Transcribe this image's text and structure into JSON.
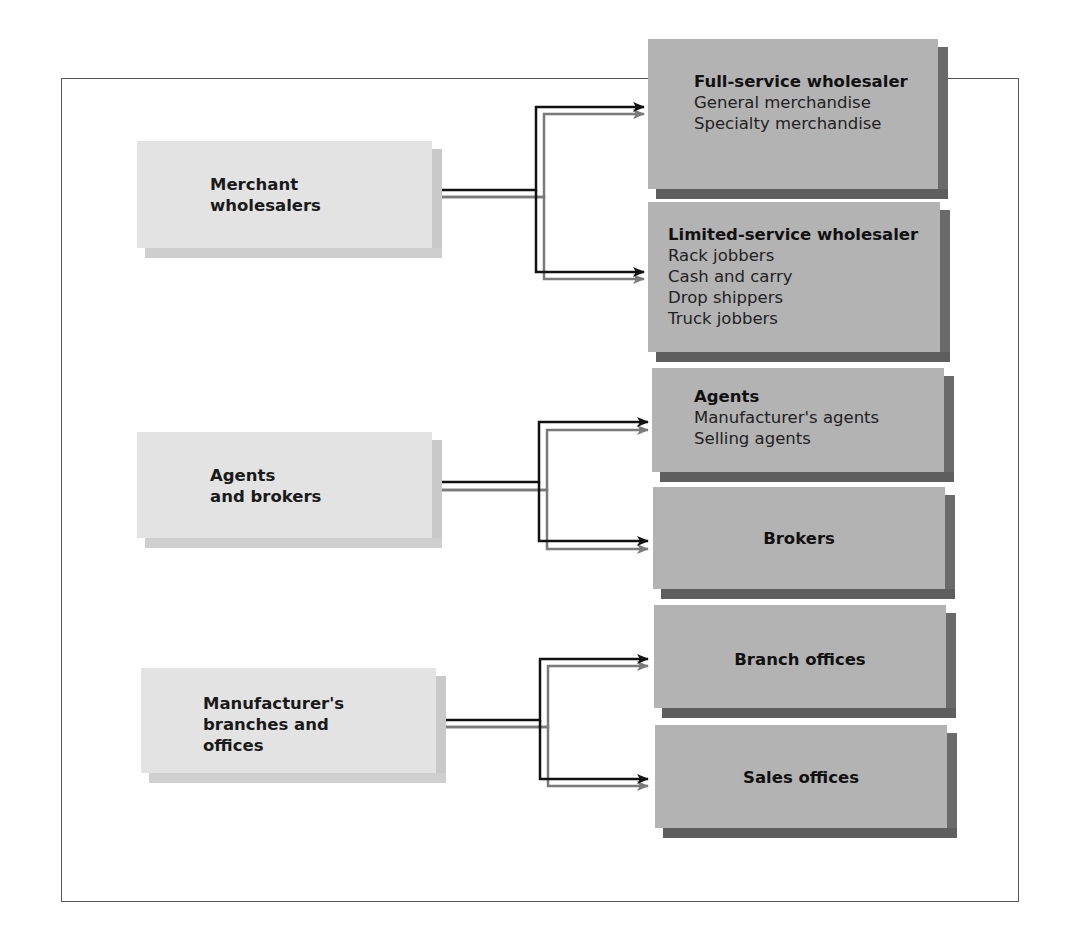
{
  "diagram": {
    "type": "hierarchy",
    "categories": [
      {
        "label_lines": [
          "Merchant",
          "wholesalers"
        ],
        "children": [
          {
            "title": "Full-service wholesaler",
            "items": [
              "General merchandise",
              "Specialty merchandise"
            ]
          },
          {
            "title": "Limited-service wholesaler",
            "items": [
              "Rack jobbers",
              "Cash and carry",
              "Drop shippers",
              "Truck jobbers"
            ]
          }
        ]
      },
      {
        "label_lines": [
          "Agents",
          "and brokers"
        ],
        "children": [
          {
            "title": "Agents",
            "items": [
              "Manufacturer's agents",
              "Selling agents"
            ]
          },
          {
            "title": "Brokers",
            "items": []
          }
        ]
      },
      {
        "label_lines": [
          "Manufacturer's",
          "branches and",
          "offices"
        ],
        "children": [
          {
            "title": "Branch offices",
            "items": []
          },
          {
            "title": "Sales offices",
            "items": []
          }
        ]
      }
    ]
  },
  "colors": {
    "left_box_face": "#e3e3e3",
    "right_box_face": "#b3b3b3",
    "right_box_shadow": "#606060",
    "connector_dark": "#111111",
    "connector_light": "#7a7a7a"
  }
}
